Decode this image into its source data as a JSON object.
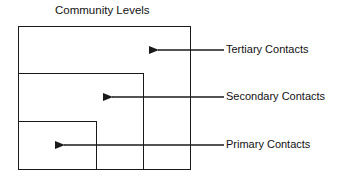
{
  "diagram": {
    "title": "Community Levels",
    "levels": [
      {
        "name": "tertiary",
        "label": "Tertiary Contacts"
      },
      {
        "name": "secondary",
        "label": "Secondary Contacts"
      },
      {
        "name": "primary",
        "label": "Primary Contacts"
      }
    ]
  }
}
